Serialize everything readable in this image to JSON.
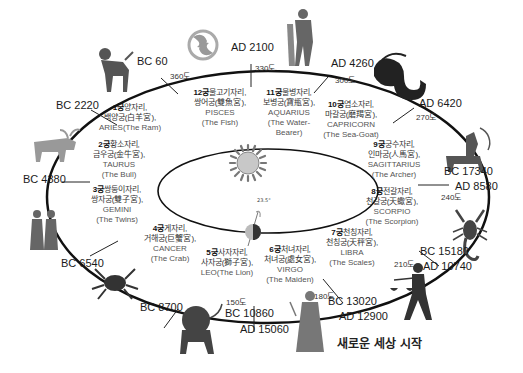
{
  "diagram": {
    "type": "precession-of-zodiac-ages",
    "caption": "새로운 세상 시작",
    "center": {
      "sun": "sun-icon",
      "earth": "earth-icon",
      "tilt": "23.5°"
    },
    "signs": [
      {
        "house": "1궁",
        "korean": "양자리,",
        "hanja": "백양궁(白羊宮),",
        "latin": "ARIES(The Ram)",
        "latin2": ""
      },
      {
        "house": "2궁",
        "korean": "황소자리,",
        "hanja": "금우궁(金牛宮),",
        "latin": "TAURUS",
        "latin2": "(The Bull)"
      },
      {
        "house": "3궁",
        "korean": "쌍둥이자리,",
        "hanja": "쌍자궁(雙子宮),",
        "latin": "GEMINI",
        "latin2": "(The Twins)"
      },
      {
        "house": "4궁",
        "korean": "게자리,",
        "hanja": "거해궁(巨蟹宮),",
        "latin": "CANCER",
        "latin2": "(The Crab)"
      },
      {
        "house": "5궁",
        "korean": "사자자리,",
        "hanja": "사자궁(獅子宮),",
        "latin": "LEO(The Lion)",
        "latin2": ""
      },
      {
        "house": "6궁",
        "korean": "처녀자리,",
        "hanja": "처녀궁(處女宮),",
        "latin": "VIRGO",
        "latin2": "(The Maiden)"
      },
      {
        "house": "7궁",
        "korean": "천칭자리,",
        "hanja": "천칭궁(天秤宮),",
        "latin": "LIBRA",
        "latin2": "(The Scales)"
      },
      {
        "house": "8궁",
        "korean": "전갈자리,",
        "hanja": "천갈궁(天蠍宮),",
        "latin": "SCORPIO",
        "latin2": "(The Scorpion)"
      },
      {
        "house": "9궁",
        "korean": "궁수자리,",
        "hanja": "인마궁(人馬宮),",
        "latin": "SAGITTARIUS",
        "latin2": "(The Archer)"
      },
      {
        "house": "10궁",
        "korean": "염소자리,",
        "hanja": "마갈궁(磨羯宮),",
        "latin": "CAPRICORN",
        "latin2": "(The Sea-Goat)"
      },
      {
        "house": "11궁",
        "korean": "물병자리,",
        "hanja": "보병궁(寶甁宮),",
        "latin": "AQUARIUS",
        "latin2": "(The Water-",
        "latin3": "Bearer)"
      },
      {
        "house": "12궁",
        "korean": "물고기자리,",
        "hanja": "쌍어궁(雙魚宮),",
        "latin": "PISCES",
        "latin2": "(The Fish)"
      }
    ],
    "boundaries": [
      {
        "era": "BC 60",
        "degree": "360도"
      },
      {
        "era": "AD 2100",
        "degree": "330도"
      },
      {
        "era": "AD 4260",
        "degree": "300도"
      },
      {
        "era": "AD 6420",
        "degree": "270도"
      },
      {
        "era": "BC 17340",
        "era2": "AD 8580",
        "degree": "240도"
      },
      {
        "era": "BC 15180",
        "era2": "AD 10740",
        "degree": "210도"
      },
      {
        "era": "BC 13020",
        "era2": "AD 12900",
        "degree": "180도"
      },
      {
        "era": "BC 10860",
        "era2": "AD 15060",
        "degree": "150도"
      },
      {
        "era": "BC 8700"
      },
      {
        "era": "BC 6540"
      },
      {
        "era": "BC 4380"
      },
      {
        "era": "BC 2220"
      }
    ],
    "icons": [
      "ram-icon",
      "pisces-icon",
      "aquarius-icon",
      "capricorn-icon",
      "sagittarius-icon",
      "scorpion-icon",
      "libra-icon",
      "virgo-icon",
      "lion-icon",
      "crab-icon",
      "gemini-icon",
      "bull-icon"
    ]
  }
}
